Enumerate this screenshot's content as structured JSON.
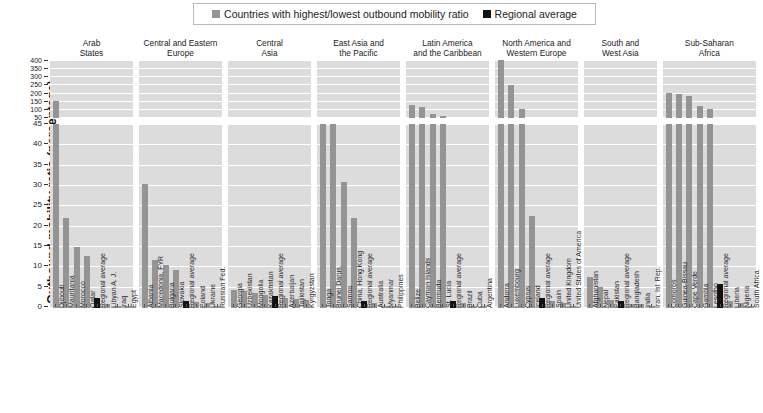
{
  "legend": {
    "items": [
      {
        "label": "Countries with highest/lowest outbound mobility ratio",
        "color": "#949494",
        "icon": "square-swatch"
      },
      {
        "label": "Regional average",
        "color": "#111111",
        "icon": "square-swatch"
      }
    ]
  },
  "axis": {
    "y_title": "Outbound mobility ratio (percentage)",
    "upper_ticks": [
      "400",
      "350",
      "300",
      "250",
      "200",
      "150",
      "100",
      "50"
    ],
    "lower_ticks": [
      "45",
      "40",
      "35",
      "30",
      "25",
      "20",
      "15",
      "10",
      "5",
      "0"
    ]
  },
  "chart_data": {
    "type": "bar",
    "title": "",
    "xlabel": "",
    "ylabel": "Outbound mobility ratio (percentage)",
    "broken_axis": true,
    "lower_ylim": [
      0,
      45
    ],
    "upper_ylim": [
      50,
      400
    ],
    "grid": true,
    "legend_position": "top",
    "series": [
      {
        "name": "Countries with highest/lowest outbound mobility ratio",
        "color": "#949494"
      },
      {
        "name": "Regional average",
        "color": "#111111"
      }
    ],
    "groups": [
      {
        "name": "Arab States",
        "title_lines": [
          "Arab",
          "States"
        ],
        "categories": [
          "Djibouti",
          "Mauritania",
          "Morocco",
          "Qatar",
          "Regional average",
          "Libyan A. J.",
          "Iraq",
          "Egypt"
        ],
        "values": [
          150,
          22,
          15,
          12.8,
          2.5,
          0.9,
          0.6,
          0.4
        ],
        "is_average": [
          false,
          false,
          false,
          false,
          true,
          false,
          false,
          false
        ]
      },
      {
        "name": "Central and Eastern Europe",
        "title_lines": [
          "Central and Eastern",
          "Europe"
        ],
        "categories": [
          "Albania",
          "Macedonia, FYR",
          "Bulgaria",
          "Slovakia",
          "Regional average",
          "Poland",
          "Ukraine",
          "Russian Fed."
        ],
        "values": [
          30.3,
          11.8,
          10.6,
          9.3,
          1.8,
          1.5,
          1.2,
          0.6
        ],
        "is_average": [
          false,
          false,
          false,
          false,
          true,
          false,
          false,
          false
        ]
      },
      {
        "name": "Central Asia",
        "title_lines": [
          "Central",
          "Asia"
        ],
        "categories": [
          "Georgia",
          "Uzbekistan",
          "Mongolia",
          "Kazakhstan",
          "Regional average",
          "Azerbaijan",
          "Tajikistan",
          "Kyrgyzstan"
        ],
        "values": [
          4.3,
          4.1,
          3.6,
          3.3,
          3.0,
          2.4,
          2.1,
          1.9
        ],
        "is_average": [
          false,
          false,
          false,
          false,
          true,
          false,
          false,
          false
        ]
      },
      {
        "name": "East Asia and the Pacific",
        "title_lines": [
          "East Asia and",
          "the Pacific"
        ],
        "categories": [
          "Tonga",
          "Brunei Darus.",
          "Samoa",
          "China, Hong Kong",
          "Regional average",
          "Australia",
          "Myanmar",
          "Philippines"
        ],
        "values": [
          45,
          45,
          30.8,
          22.1,
          1.8,
          1.3,
          0.6,
          0.4
        ],
        "is_average": [
          false,
          false,
          false,
          false,
          true,
          false,
          false,
          false
        ]
      },
      {
        "name": "Latin America and the Caribbean",
        "title_lines": [
          "Latin America",
          "and the Caribbean"
        ],
        "categories": [
          "Belize",
          "Cayman Islands",
          "Bermuda",
          "St. Lucia",
          "Regional average",
          "Brazil",
          "Cuba",
          "Argentina"
        ],
        "values": [
          130,
          115,
          75,
          62,
          1.6,
          1.2,
          0.5,
          0.4
        ],
        "is_average": [
          false,
          false,
          false,
          false,
          true,
          false,
          false,
          false
        ]
      },
      {
        "name": "North America and Western Europe",
        "title_lines": [
          "North America and",
          "Western Europe"
        ],
        "categories": [
          "Andorra",
          "Luxembourg",
          "Cyprus",
          "Iceland",
          "Regional average",
          "Spain",
          "United Kingdom",
          "United States of America"
        ],
        "values": [
          400,
          250,
          105,
          22.4,
          2.5,
          1.6,
          1.2,
          0.5
        ],
        "is_average": [
          false,
          false,
          false,
          false,
          true,
          false,
          false,
          false
        ]
      },
      {
        "name": "South and West Asia",
        "title_lines": [
          "South and",
          "West Asia"
        ],
        "categories": [
          "Afghanistan",
          "Nepal",
          "Pakistan",
          "Regional average",
          "Bangladesh",
          "India",
          "Iran, Isl. Rep."
        ],
        "values": [
          7.6,
          5.2,
          2.0,
          1.6,
          1.0,
          0.9,
          0.6
        ],
        "is_average": [
          false,
          false,
          false,
          true,
          false,
          false,
          false
        ]
      },
      {
        "name": "Sub-Saharan Africa",
        "title_lines": [
          "Sub-Saharan",
          "Africa"
        ],
        "categories": [
          "Comoros",
          "Guinea-Bissau",
          "Cape Verde",
          "Gambia",
          "Lesotho",
          "Regional average",
          "Liberia",
          "Nigeria",
          "South Africa"
        ],
        "values": [
          200,
          195,
          185,
          120,
          105,
          5.8,
          1.8,
          1.2,
          0.6
        ],
        "is_average": [
          false,
          false,
          false,
          false,
          false,
          true,
          false,
          false,
          false
        ]
      }
    ]
  }
}
